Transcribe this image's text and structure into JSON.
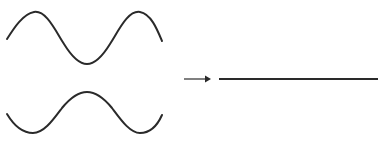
{
  "figure": {
    "width": 388,
    "height": 163,
    "background_color": "#ffffff",
    "stroke_color": "#2a2a2a",
    "arrow_color": "#2a2a2a"
  },
  "elements": {
    "wave_top": {
      "name": "input wave 1",
      "description": "sinusoidal wave starting on a rising edge, crest, trough, crest",
      "stroke_width": 2.0,
      "baseline_y": 39,
      "amplitude": 27,
      "start_point": [
        7,
        39
      ],
      "end_point": [
        162,
        41
      ],
      "crest_points": [
        [
          34,
          12
        ],
        [
          140,
          12
        ]
      ],
      "trough_points": [
        [
          87,
          64
        ]
      ],
      "phase_label": "0°"
    },
    "wave_bottom": {
      "name": "input wave 2",
      "description": "sinusoidal wave inverted relative to wave 1, trough, crest, trough",
      "stroke_width": 2.0,
      "baseline_y": 116,
      "amplitude": 24,
      "start_point": [
        7,
        114
      ],
      "end_point": [
        162,
        115
      ],
      "crest_points": [
        [
          87,
          92
        ]
      ],
      "trough_points": [
        [
          33,
          133
        ],
        [
          140,
          133
        ]
      ],
      "phase_label": "180°"
    },
    "arrow": {
      "name": "transformation arrow",
      "direction": "right",
      "shaft_start": [
        184,
        79
      ],
      "shaft_end": [
        205,
        79
      ],
      "head_tip": [
        211,
        79
      ],
      "head_width": 6,
      "head_height": 7,
      "stroke_width": 1.2
    },
    "flat_line": {
      "name": "resultant wave",
      "description": "flat horizontal line indicating zero amplitude result",
      "start_point": [
        219,
        79
      ],
      "end_point": [
        378,
        79
      ],
      "stroke_width": 2.0,
      "amplitude": 0
    }
  },
  "chart_data": {
    "type": "line",
    "xlabel": "",
    "ylabel": "",
    "grid": false,
    "legend_position": "none",
    "xlim": [
      0,
      2
    ],
    "ylim": [
      -1.2,
      1.2
    ],
    "series": [
      {
        "name": "input wave 1",
        "phase_deg": 0,
        "amplitude": 1,
        "cycles": 2,
        "panel": "left-top",
        "x": [
          0,
          0.125,
          0.25,
          0.375,
          0.5,
          0.625,
          0.75,
          0.875,
          1,
          1.125,
          1.25,
          1.375,
          1.5,
          1.625,
          1.75
        ],
        "values": [
          0,
          0.707,
          1,
          0.707,
          0,
          -0.707,
          -1,
          -0.707,
          0,
          0.707,
          1,
          0.707,
          0,
          -0.707,
          -1
        ]
      },
      {
        "name": "input wave 2",
        "phase_deg": 180,
        "amplitude": 1,
        "cycles": 2,
        "panel": "left-bottom",
        "x": [
          0,
          0.125,
          0.25,
          0.375,
          0.5,
          0.625,
          0.75,
          0.875,
          1,
          1.125,
          1.25,
          1.375,
          1.5,
          1.625,
          1.75
        ],
        "values": [
          0,
          -0.707,
          -1,
          -0.707,
          0,
          0.707,
          1,
          0.707,
          0,
          -0.707,
          -1,
          -0.707,
          0,
          0.707,
          1
        ]
      },
      {
        "name": "resultant wave",
        "phase_deg": 0,
        "amplitude": 0,
        "cycles": 0,
        "panel": "right",
        "x": [
          0,
          0.25,
          0.5,
          0.75,
          1,
          1.25,
          1.5,
          1.75,
          2
        ],
        "values": [
          0,
          0,
          0,
          0,
          0,
          0,
          0,
          0,
          0
        ]
      }
    ],
    "annotations": []
  }
}
